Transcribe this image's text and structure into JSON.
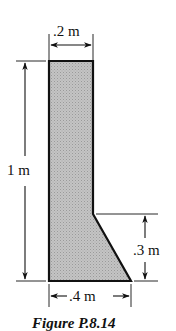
{
  "figure": {
    "caption": "Figure P.8.14",
    "shape": {
      "description": "L-shaped cross-section with slanted toe (shaded)",
      "fill_color": "#bdbdbd",
      "outline_color": "#111111"
    },
    "dimensions": {
      "top_width": ".2 m",
      "height": "1 m",
      "toe_height": ".3 m",
      "base_width": ".4 m"
    }
  }
}
